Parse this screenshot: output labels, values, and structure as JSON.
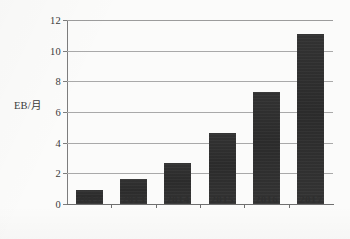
{
  "chart_data": {
    "type": "bar",
    "title": "",
    "subtitle": "",
    "xlabel": "",
    "ylabel": "EB/月",
    "categories": [
      "2012",
      "2013",
      "2014",
      "2015",
      "2016",
      "2017"
    ],
    "values": [
      0.9,
      1.6,
      2.7,
      4.6,
      7.3,
      11.1
    ],
    "series": [
      {
        "name": "",
        "values": [
          0.9,
          1.6,
          2.7,
          4.6,
          7.3,
          11.1
        ]
      }
    ],
    "ylim": [
      0,
      12
    ],
    "yticks": [
      0,
      2,
      4,
      6,
      8,
      10,
      12
    ],
    "ytick_labels": [
      "0",
      "2",
      "4",
      "6",
      "8",
      "10",
      "12"
    ],
    "grid": "horizontal",
    "legend": "none",
    "bar_color": "#2e2e2e",
    "gridline_color": "#a9a9a9",
    "axis_color": "#6f6f6f",
    "background_color": "#fbfbfa",
    "annotations": []
  }
}
